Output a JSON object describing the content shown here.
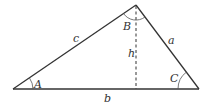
{
  "diagram": {
    "title": "",
    "vertices": {
      "A": {
        "x": 13,
        "y": 89
      },
      "B": {
        "x": 136,
        "y": 5
      },
      "C": {
        "x": 199,
        "y": 89
      }
    },
    "altitude_foot": {
      "x": 136,
      "y": 89
    },
    "labels": {
      "side_a": "a",
      "side_b": "b",
      "side_c": "c",
      "angle_A": "A",
      "angle_B": "B",
      "angle_C": "C",
      "height": "h"
    },
    "colors": {
      "stroke": "#333333",
      "background": "#ffffff"
    }
  }
}
